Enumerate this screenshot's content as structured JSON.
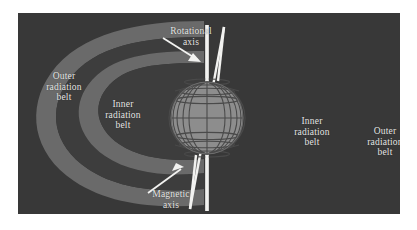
{
  "figure": {
    "background_color": "#ffffff",
    "panel_color": "#383838",
    "belt_color": "#6a6a6a",
    "gap_color": "#3d3d3d",
    "globe_color": "#8d8d8d",
    "globe_grid_color": "#4a4a4a",
    "axis_color": "#f2f2f0",
    "label_color": "#e8e8e6"
  },
  "labels": {
    "outer_left": {
      "lines": [
        "Outer",
        "radiation",
        "belt"
      ],
      "text": "Outer\nradiation\nbelt"
    },
    "inner_left": {
      "lines": [
        "Inner",
        "radiation",
        "belt"
      ],
      "text": "Inner\nradiation\nbelt"
    },
    "inner_right": {
      "lines": [
        "Inner",
        "radiation",
        "belt"
      ],
      "text": "Inner\nradiation\nbelt"
    },
    "outer_right": {
      "lines": [
        "Outer",
        "radiation",
        "belt"
      ],
      "text": "Outer\nradiation\nbelt"
    },
    "rotational_axis": {
      "lines": [
        "Rotational",
        "axis"
      ],
      "text": "Rotational\naxis"
    },
    "magnetic_axis": {
      "lines": [
        "Magnetic",
        "axis"
      ],
      "text": "Magnetic\naxis"
    }
  },
  "diagram_elements": {
    "globe": {
      "name": "earth-globe",
      "meridian_count": 13,
      "parallel_count": 7,
      "center_x": 189,
      "center_y": 105,
      "radius": 36
    },
    "rotational_axis_line": {
      "name": "rotational-axis-line",
      "orientation": "vertical",
      "tilt_degrees": 0
    },
    "magnetic_axis_line": {
      "name": "magnetic-axis-line",
      "orientation": "tilted",
      "tilt_degrees": 11
    },
    "belts": [
      {
        "name": "outer-radiation-belt-left",
        "side": "left",
        "tier": "outer"
      },
      {
        "name": "inner-radiation-belt-left",
        "side": "left",
        "tier": "inner"
      },
      {
        "name": "inner-radiation-belt-right",
        "side": "right",
        "tier": "inner"
      },
      {
        "name": "outer-radiation-belt-right",
        "side": "right",
        "tier": "outer"
      }
    ],
    "pointers": [
      {
        "name": "rotational-axis-arrow",
        "direction": "down-right"
      },
      {
        "name": "magnetic-axis-arrow",
        "direction": "up-right"
      }
    ]
  }
}
